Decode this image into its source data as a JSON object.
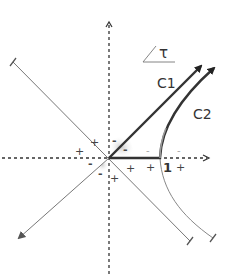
{
  "diagram": {
    "type": "spacetime-hyperbola",
    "labels": {
      "tau": "τ",
      "c1": "C1",
      "c2": "C2",
      "unit": "1"
    },
    "signs": [
      {
        "text": "+",
        "x": 90,
        "y": 146
      },
      {
        "text": "+",
        "x": 75,
        "y": 155
      },
      {
        "text": "-",
        "x": 113,
        "y": 145
      },
      {
        "text": "-",
        "x": 124,
        "y": 153
      },
      {
        "text": "-",
        "x": 88,
        "y": 166
      },
      {
        "text": "-",
        "x": 99,
        "y": 176
      },
      {
        "text": "+",
        "x": 110,
        "y": 181
      },
      {
        "text": "+",
        "x": 128,
        "y": 171
      },
      {
        "text": "+",
        "x": 148,
        "y": 170
      },
      {
        "text": "+",
        "x": 178,
        "y": 170
      }
    ],
    "light_signs": [
      {
        "text": "-",
        "x": 146,
        "y": 153
      },
      {
        "text": "-",
        "x": 177,
        "y": 153
      }
    ],
    "colors": {
      "thick_path": "#333333",
      "thin_line": "#777777",
      "curve_light": "#999999",
      "axis": "#333333"
    }
  }
}
